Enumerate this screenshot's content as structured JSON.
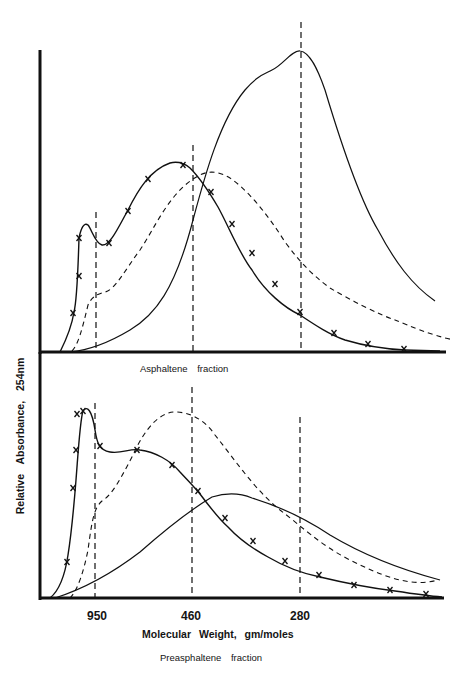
{
  "chart_data": [
    {
      "type": "line",
      "title": "Asphaltene fraction",
      "xlabel": "Molecular Weight, gm/moles",
      "ylabel": "Relative Absorbance, 254nm",
      "x_reference_lines": [
        {
          "label": "950",
          "x_px": 96
        },
        {
          "label": "460",
          "x_px": 193
        },
        {
          "label": "280",
          "x_px": 301
        }
      ],
      "series": [
        {
          "name": "curve with x markers",
          "style": "solid",
          "markers": "x",
          "path": "M60,352 C66,340 72,325 74,312 C77,300 78,272 79,238 C81,228 84,222 88,225 C92,230 95,243 102,245 C110,246 118,228 128,210 C138,190 150,170 170,163 C178,161 184,163 190,168 C200,178 208,190 218,207 C228,225 240,255 252,270 C265,292 285,308 300,315 C315,325 330,335 345,340 C365,346 385,349 405,350 L440,351",
          "marker_points": [
            [
              73,
              313
            ],
            [
              79,
              276
            ],
            [
              79,
              238
            ],
            [
              109,
              243
            ],
            [
              128,
              211
            ],
            [
              148,
              179
            ],
            [
              183,
              165
            ],
            [
              211,
              192
            ],
            [
              232,
              224
            ],
            [
              252,
              253
            ],
            [
              275,
              284
            ],
            [
              300,
              312
            ],
            [
              334,
              333
            ],
            [
              368,
              344
            ],
            [
              404,
              349
            ]
          ]
        },
        {
          "name": "dashed curve",
          "style": "dashed",
          "path": "M72,351 C78,345 82,330 88,305 C92,296 98,294 105,292 C115,290 125,270 140,250 C155,228 170,190 200,175 C210,170 220,172 230,178 C245,188 265,210 285,242 C300,262 312,275 330,288 C350,300 380,315 395,320 C410,326 430,335 454,340"
        },
        {
          "name": "solid curve (tall)",
          "style": "solid",
          "path": "M70,352 C90,350 110,342 130,330 C155,315 175,290 193,220 C205,175 220,120 245,90 C258,75 265,74 272,70 C282,66 292,50 300,51 C310,52 318,70 325,90 C340,140 360,200 378,230 C395,262 412,285 435,301"
        }
      ]
    },
    {
      "type": "line",
      "title": "Preasphaltene fraction",
      "xlabel": "Molecular Weight, gm/moles",
      "ylabel": "Relative Absorbance, 254nm",
      "x_ticks": [
        "950",
        "460",
        "280"
      ],
      "x_reference_lines": [
        {
          "label": "950",
          "x_px": 95
        },
        {
          "label": "460",
          "x_px": 192
        },
        {
          "label": "280",
          "x_px": 300
        }
      ],
      "series": [
        {
          "name": "curve with x markers",
          "style": "solid",
          "markers": "x",
          "path": "M50,598 C60,590 65,575 68,555 C72,530 74,505 76,480 C78,455 80,420 83,411 C87,405 92,410 95,430 C97,443 99,450 110,452 C122,454 130,448 140,450 C155,452 170,460 180,472 C192,485 195,488 200,494 C212,510 220,520 228,527 C240,540 255,550 268,557 C285,567 300,573 320,577 C345,583 370,588 395,591 C415,594 430,596 442,597",
          "marker_points": [
            [
              67,
              562
            ],
            [
              73,
              488
            ],
            [
              76,
              450
            ],
            [
              77,
              414
            ],
            [
              83,
              411
            ],
            [
              100,
              446
            ],
            [
              137,
              450
            ],
            [
              172,
              465
            ],
            [
              198,
              491
            ],
            [
              225,
              518
            ],
            [
              253,
              541
            ],
            [
              285,
              561
            ],
            [
              319,
              575
            ],
            [
              354,
              585
            ],
            [
              390,
              590
            ],
            [
              426,
              594
            ]
          ]
        },
        {
          "name": "dashed curve",
          "style": "dashed",
          "path": "M70,598 C78,590 84,570 88,550 C92,520 94,508 102,501 C112,495 120,480 133,455 C145,428 160,412 175,412 C190,412 205,420 215,435 C235,460 255,490 280,510 C300,525 320,545 350,560 C380,575 410,588 438,580"
        },
        {
          "name": "solid curve (broad)",
          "style": "solid",
          "path": "M55,598 C80,590 110,575 140,552 C165,530 190,510 212,497 C225,493 240,493 252,498 C275,505 300,515 330,535 C360,553 395,568 440,580"
        }
      ]
    }
  ],
  "labels": {
    "ylabel": "Relative Absorbance, 254nm",
    "xlabel": "Molecular Weight, gm/moles",
    "upper_panel_caption": "Asphaltene fraction",
    "lower_panel_caption": "Preasphaltene fraction",
    "ticks": [
      "950",
      "460",
      "280"
    ]
  }
}
